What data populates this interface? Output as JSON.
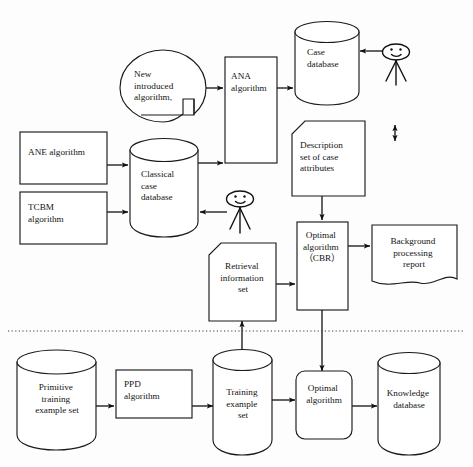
{
  "diagram": {
    "colors": {
      "stroke": "#1a1a1a",
      "background": "#ffffff",
      "connector": "#111111",
      "divider": "#3a3a3a"
    },
    "nodes": {
      "new_introduced_algorithm": {
        "shape": "callout-ellipse",
        "lines": [
          "New",
          "introduced",
          "algorithm,"
        ]
      },
      "ana_algorithm": {
        "shape": "rectangle",
        "lines": [
          "ANA",
          "algorithm"
        ]
      },
      "case_database": {
        "shape": "cylinder",
        "lines": [
          "Case",
          "database"
        ]
      },
      "ane_algorithm": {
        "shape": "rectangle",
        "lines": [
          "ANE algorithm"
        ]
      },
      "tcbm_algorithm": {
        "shape": "rectangle",
        "lines": [
          "TCBM",
          "algorithm"
        ]
      },
      "classical_case_database": {
        "shape": "cylinder",
        "lines": [
          "Classical",
          "case",
          "database"
        ]
      },
      "description_set_of_case_attributes": {
        "shape": "document-cut-corner",
        "lines": [
          "Description",
          "set of case",
          "attributes"
        ]
      },
      "retrieval_information_set": {
        "shape": "document-cut-corner",
        "lines": [
          "Retrieval",
          "information",
          "set"
        ]
      },
      "optimal_algorithm_cbr": {
        "shape": "rectangle",
        "lines": [
          "Optimal",
          "algorithm",
          "（CBR）"
        ]
      },
      "background_processing_report": {
        "shape": "document-wavy",
        "lines": [
          "Background",
          "processing",
          "report"
        ]
      },
      "primitive_training_example_set": {
        "shape": "cylinder",
        "lines": [
          "Primitive",
          "training",
          "example set"
        ]
      },
      "ppd_algorithm": {
        "shape": "rectangle",
        "lines": [
          "PPD",
          "algorithm"
        ]
      },
      "training_example_set": {
        "shape": "cylinder",
        "lines": [
          "Training",
          "example",
          "set"
        ]
      },
      "optimal_algorithm": {
        "shape": "rounded-rectangle",
        "lines": [
          "Optimal",
          "algorithm"
        ]
      },
      "knowledge_database": {
        "shape": "cylinder",
        "lines": [
          "Knowledge",
          "database"
        ]
      },
      "user_actor_top": {
        "shape": "stick-figure",
        "label": ""
      },
      "user_actor_middle": {
        "shape": "stick-figure",
        "label": ""
      },
      "sync_double_arrow": {
        "shape": "double-headed-arrow",
        "label": ""
      },
      "section_divider": {
        "shape": "dotted-line",
        "label": ""
      }
    },
    "edges": [
      {
        "from": "new_introduced_algorithm",
        "to": "ana_algorithm"
      },
      {
        "from": "ana_algorithm",
        "to": "case_database"
      },
      {
        "from": "user_actor_top",
        "to": "case_database"
      },
      {
        "from": "ane_algorithm",
        "to": "classical_case_database"
      },
      {
        "from": "tcbm_algorithm",
        "to": "classical_case_database"
      },
      {
        "from": "user_actor_middle",
        "to": "classical_case_database"
      },
      {
        "from": "classical_case_database",
        "to": "ana_algorithm"
      },
      {
        "from": "description_set_of_case_attributes",
        "to": "optimal_algorithm_cbr"
      },
      {
        "from": "retrieval_information_set",
        "to": "optimal_algorithm_cbr"
      },
      {
        "from": "optimal_algorithm_cbr",
        "to": "background_processing_report"
      },
      {
        "from": "optimal_algorithm_cbr",
        "to": "optimal_algorithm"
      },
      {
        "from": "primitive_training_example_set",
        "to": "ppd_algorithm"
      },
      {
        "from": "ppd_algorithm",
        "to": "training_example_set"
      },
      {
        "from": "training_example_set",
        "to": "optimal_algorithm"
      },
      {
        "from": "training_example_set",
        "to": "retrieval_information_set"
      },
      {
        "from": "optimal_algorithm",
        "to": "knowledge_database"
      }
    ]
  }
}
